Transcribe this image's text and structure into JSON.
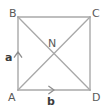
{
  "figure": {
    "type": "geometry-diagram",
    "shape": "square",
    "background_color": "#ffffff",
    "line_color": "#a8a8a8",
    "label_color": "#5a5a5a",
    "vector_label_color": "#3c3c3c",
    "vertices": [
      {
        "id": "B",
        "label": "B",
        "x": 18,
        "y": 17,
        "position": "top-left"
      },
      {
        "id": "C",
        "label": "C",
        "x": 90,
        "y": 17,
        "position": "top-right"
      },
      {
        "id": "D",
        "label": "D",
        "x": 90,
        "y": 90,
        "position": "bottom-right"
      },
      {
        "id": "A",
        "label": "A",
        "x": 18,
        "y": 90,
        "position": "bottom-left"
      }
    ],
    "interior_points": [
      {
        "id": "N",
        "label": "N",
        "x": 54,
        "y": 53.5,
        "description": "intersection of diagonals"
      }
    ],
    "edges": [
      {
        "from": "B",
        "to": "C"
      },
      {
        "from": "C",
        "to": "D"
      },
      {
        "from": "D",
        "to": "A"
      },
      {
        "from": "A",
        "to": "B"
      }
    ],
    "diagonals": [
      {
        "from": "B",
        "to": "D"
      },
      {
        "from": "A",
        "to": "C"
      }
    ],
    "vectors": [
      {
        "id": "a",
        "label": "a",
        "from": "A",
        "direction": "up",
        "along_edge": "A-B",
        "arrow_tip_x": 18,
        "arrow_tip_y": 52
      },
      {
        "id": "b",
        "label": "b",
        "from": "A",
        "direction": "right",
        "along_edge": "A-D",
        "arrow_tip_x": 54,
        "arrow_tip_y": 90
      }
    ]
  }
}
